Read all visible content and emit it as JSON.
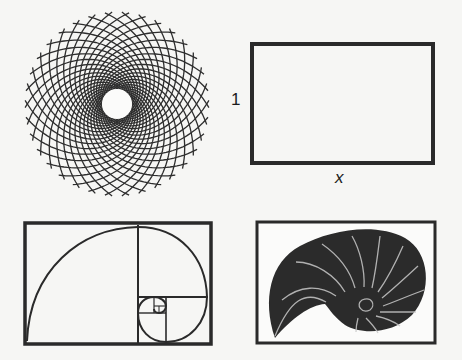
{
  "panels": [
    {
      "id": "phyllotaxis",
      "description": "Sunflower-like spiral lattice disc"
    },
    {
      "id": "golden-rectangle",
      "description": "Rectangle with sides 1 and x"
    },
    {
      "id": "golden-spiral",
      "description": "Golden spiral inscribed in subdivided rectangle"
    },
    {
      "id": "nautilus",
      "description": "Nautilus shell cross-section"
    }
  ],
  "labels": {
    "rect_height": "1",
    "rect_width": "x"
  },
  "colors": {
    "ink": "#2a2a2a",
    "paper": "#f6f6f4",
    "shell": "#2b2b2b"
  }
}
